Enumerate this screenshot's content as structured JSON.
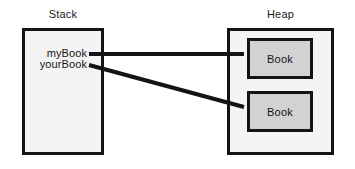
{
  "diagram": {
    "width": 355,
    "height": 169,
    "background_color": "#ffffff",
    "colors": {
      "stroke": "#141414",
      "region_fill": "#f4f4f4",
      "object_fill": "#d2d2d2",
      "text": "#141414"
    }
  },
  "regions": [
    {
      "key": "stack",
      "label": "Stack",
      "fill": "#f4f4f4",
      "x": 22,
      "y": 28,
      "width": 82,
      "height": 127
    },
    {
      "key": "heap",
      "label": "Heap",
      "fill": "#f4f4f4",
      "x": 227,
      "y": 28,
      "width": 107,
      "height": 127
    }
  ],
  "stack": {
    "label": "Stack",
    "variables": [
      {
        "name": "myBook",
        "label": "myBook"
      },
      {
        "name": "yourBook",
        "label": "yourBook"
      }
    ]
  },
  "heap": {
    "label": "Heap",
    "objects": [
      {
        "key": "book-1",
        "label": "Book",
        "fill": "#d2d2d2",
        "x": 247,
        "y": 38,
        "width": 66,
        "height": 41
      },
      {
        "key": "book-2",
        "label": "Book",
        "fill": "#d2d2d2",
        "x": 247,
        "y": 91,
        "width": 66,
        "height": 41
      }
    ]
  },
  "references": [
    {
      "key": "mybook-to-book-1",
      "from": "myBook",
      "to": "Book",
      "x1": 89,
      "y1": 54,
      "x2": 244,
      "y2": 54,
      "stroke": "#141414",
      "width": 4
    },
    {
      "key": "yourbook-to-book-2",
      "from": "yourBook",
      "to": "Book",
      "x1": 89,
      "y1": 65,
      "x2": 244,
      "y2": 107,
      "stroke": "#141414",
      "width": 4
    }
  ]
}
